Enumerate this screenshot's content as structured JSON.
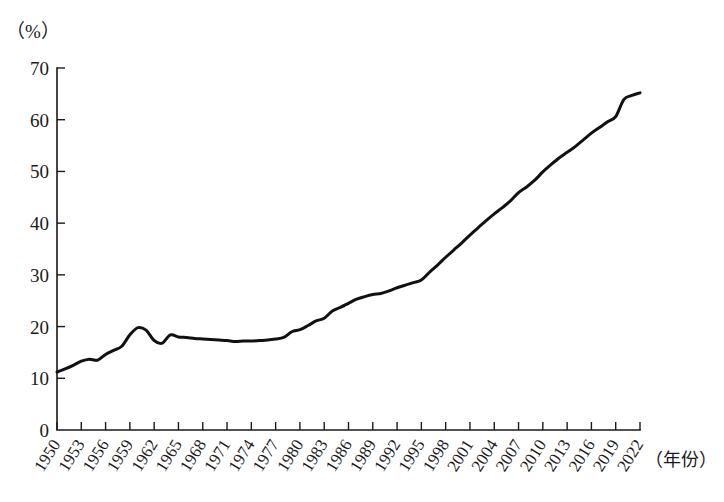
{
  "chart_data": {
    "type": "line",
    "title": "",
    "subtitle": "",
    "xlabel": "（年份）",
    "ylabel": "（%）",
    "ylim": [
      0,
      70
    ],
    "xlim": [
      1950,
      2022
    ],
    "grid": false,
    "legend": null,
    "y_ticks": [
      0,
      10,
      20,
      30,
      40,
      50,
      60,
      70
    ],
    "x_ticks": [
      1950,
      1953,
      1956,
      1959,
      1962,
      1965,
      1968,
      1971,
      1974,
      1977,
      1980,
      1983,
      1986,
      1989,
      1992,
      1995,
      1998,
      2001,
      2004,
      2007,
      2010,
      2013,
      2016,
      2019,
      2022
    ],
    "x_tick_labels": [
      "1950",
      "1953",
      "1956",
      "1959",
      "1962",
      "1965",
      "1968",
      "1971",
      "1974",
      "1977",
      "1980",
      "1983",
      "1986",
      "1989",
      "1992",
      "1995",
      "1998",
      "2001",
      "2004",
      "2007",
      "2010",
      "2013",
      "2016",
      "2019",
      "2022"
    ],
    "y_tick_labels": [
      "0",
      "10",
      "20",
      "30",
      "40",
      "50",
      "60",
      "70"
    ],
    "series": [
      {
        "name": "",
        "color": "#111111",
        "x": [
          1950,
          1951,
          1952,
          1953,
          1954,
          1955,
          1956,
          1957,
          1958,
          1959,
          1960,
          1961,
          1962,
          1963,
          1964,
          1965,
          1966,
          1967,
          1968,
          1969,
          1970,
          1971,
          1972,
          1973,
          1974,
          1975,
          1976,
          1977,
          1978,
          1979,
          1980,
          1981,
          1982,
          1983,
          1984,
          1985,
          1986,
          1987,
          1988,
          1989,
          1990,
          1991,
          1992,
          1993,
          1994,
          1995,
          1996,
          1997,
          1998,
          1999,
          2000,
          2001,
          2002,
          2003,
          2004,
          2005,
          2006,
          2007,
          2008,
          2009,
          2010,
          2011,
          2012,
          2013,
          2014,
          2015,
          2016,
          2017,
          2018,
          2019,
          2020,
          2021,
          2022
        ],
        "values": [
          11.2,
          11.8,
          12.5,
          13.3,
          13.7,
          13.5,
          14.6,
          15.4,
          16.2,
          18.4,
          19.8,
          19.3,
          17.3,
          16.8,
          18.4,
          18.0,
          17.9,
          17.7,
          17.6,
          17.5,
          17.4,
          17.3,
          17.1,
          17.2,
          17.2,
          17.3,
          17.4,
          17.6,
          17.9,
          19.0,
          19.4,
          20.2,
          21.1,
          21.6,
          23.0,
          23.7,
          24.5,
          25.3,
          25.8,
          26.2,
          26.4,
          26.9,
          27.5,
          28.0,
          28.5,
          29.0,
          30.5,
          31.9,
          33.4,
          34.8,
          36.2,
          37.7,
          39.1,
          40.5,
          41.8,
          43.0,
          44.3,
          45.9,
          47.0,
          48.3,
          49.9,
          51.3,
          52.6,
          53.7,
          54.8,
          56.1,
          57.4,
          58.5,
          59.6,
          60.6,
          63.9,
          64.7,
          65.2
        ],
        "start_value": 11.2,
        "end_value": 65.2,
        "peak_1960": 19.8,
        "trough_1963": 16.8
      }
    ]
  },
  "axis": {
    "y_unit": "（%）",
    "x_title": "（年份）"
  }
}
